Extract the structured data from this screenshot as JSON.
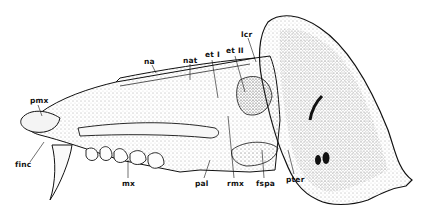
{
  "figure": {
    "colors": {
      "ink": "#111111",
      "stipple": "#555555",
      "background": "#ffffff"
    },
    "labels": [
      {
        "id": "na",
        "text": "na",
        "x": 144,
        "y": 58
      },
      {
        "id": "nat",
        "text": "nat",
        "x": 183,
        "y": 57
      },
      {
        "id": "et1",
        "text": "et I",
        "x": 207,
        "y": 52
      },
      {
        "id": "et2",
        "text": "et II",
        "x": 227,
        "y": 48
      },
      {
        "id": "lcr",
        "text": "lcr",
        "x": 241,
        "y": 31
      },
      {
        "id": "pmx",
        "text": "pmx",
        "x": 30,
        "y": 97
      },
      {
        "id": "finc",
        "text": "finc",
        "x": 15,
        "y": 164
      },
      {
        "id": "mx",
        "text": "mx",
        "x": 122,
        "y": 181
      },
      {
        "id": "pal",
        "text": "pal",
        "x": 196,
        "y": 181
      },
      {
        "id": "rmx",
        "text": "rmx",
        "x": 228,
        "y": 181
      },
      {
        "id": "fspa",
        "text": "fspa",
        "x": 257,
        "y": 181
      },
      {
        "id": "pter",
        "text": "pter",
        "x": 287,
        "y": 177
      }
    ]
  }
}
